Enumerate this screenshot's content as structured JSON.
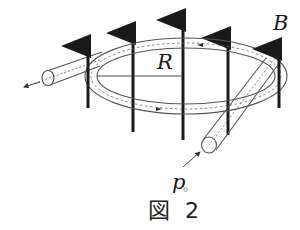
{
  "figure": {
    "caption": "図 2",
    "labels": {
      "radius": "R",
      "field": "B",
      "momentum_symbol": "p",
      "momentum_subscript": "0"
    },
    "elements": {
      "ring": "circular beam tube (storage ring) of radius R",
      "field_arrows": "uniform magnetic field B pointing upward (5 arrows)",
      "injection_tube": "straight tube at front right, particle enters with momentum p0",
      "extraction_tube": "straight tube at left, particle exits",
      "orbit": "dashed particle trajectory inside tube, circulating clockwise as viewed"
    },
    "colors": {
      "ink": "#1a1a1a",
      "tube": "#555555",
      "dashed": "#666666"
    }
  }
}
